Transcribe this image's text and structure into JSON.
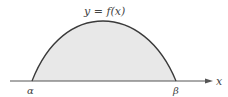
{
  "diagram": {
    "curve_label": "y = f(x)",
    "axis_label": "x",
    "left_root_label": "α",
    "right_root_label": "β",
    "colors": {
      "curve": "#3a3a3a",
      "fill": "#e8e8e8",
      "axis": "#555555",
      "text": "#444444"
    }
  }
}
